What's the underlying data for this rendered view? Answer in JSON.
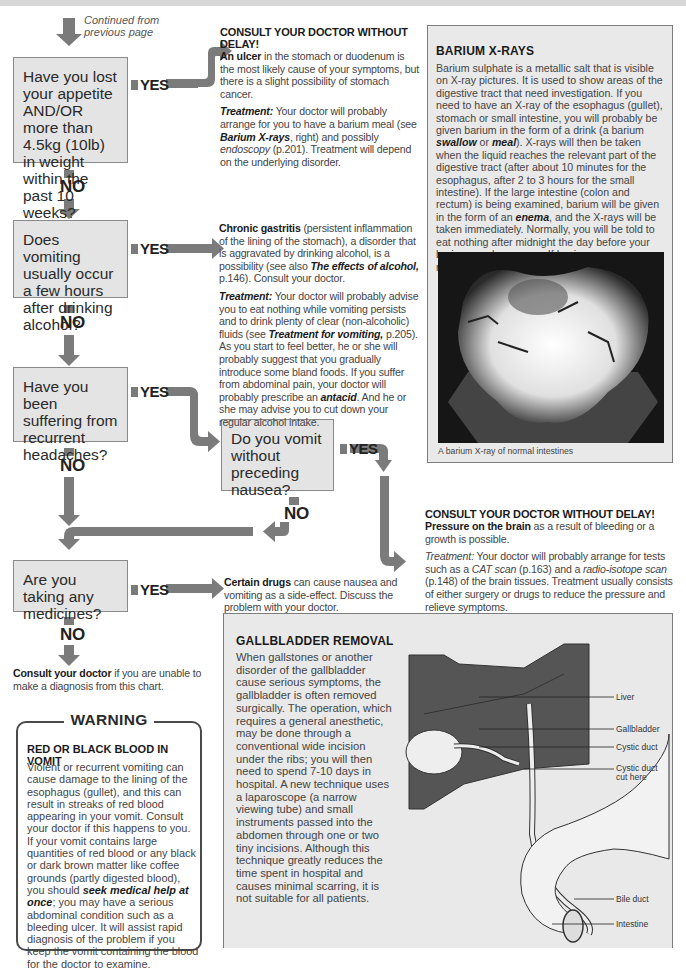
{
  "continued_note": "Continued from previous page",
  "flow_labels": {
    "yes": "YES",
    "no": "NO"
  },
  "questions": [
    {
      "id": "appetite",
      "text": "Have you lost your appetite AND/OR more than 4.5kg (10lb) in weight within the past 10 weeks?"
    },
    {
      "id": "alcohol",
      "text": "Does vomiting usually occur a few hours after drinking alcohol?"
    },
    {
      "id": "headaches",
      "text": "Have you been suffering from recurrent headaches?"
    },
    {
      "id": "nausea",
      "text": "Do you vomit without preceding nausea?"
    },
    {
      "id": "medicines",
      "text": "Are you taking any medicines?"
    }
  ],
  "answers": {
    "ulcer": {
      "heading": "CONSULT YOUR DOCTOR WITHOUT DELAY!",
      "lead_bold": "An ulcer",
      "lead_rest": " in the stomach or duodenum is the most likely cause of your symptoms, but there is a slight possibility of stomach cancer.",
      "treatment_label": "Treatment:",
      "treatment_a": " Your doctor will probably arrange for you to have a barium meal (see ",
      "treatment_ref1": "Barium X-rays",
      "treatment_b": ", right) and possibly ",
      "treatment_ref2": "endoscopy",
      "treatment_c": " (p.201). Treatment will depend on the underlying disorder."
    },
    "gastritis": {
      "lead_bold": "Chronic gastritis",
      "lead_a": " (persistent inflammation of the lining of the stomach), a disorder that is aggravated by drinking alcohol, is a possibility (see also ",
      "lead_ref": "The effects of alcohol,",
      "lead_b": " p.146). Consult your doctor.",
      "treatment_label": "Treatment:",
      "treatment_a": " Your doctor will probably advise you to eat nothing while vomiting persists and to drink plenty of clear (non-alcoholic) fluids (see ",
      "treatment_ref1": "Treatment for vomiting,",
      "treatment_b": " p.205). As you start to feel better, he or she will probably suggest that you gradually introduce some bland foods. If you suffer from abdominal pain, your doctor will probably prescribe an ",
      "treatment_ref2": "antacid",
      "treatment_c": ". And he or she may advise you to cut down your regular alcohol intake."
    },
    "brain": {
      "heading": "CONSULT YOUR DOCTOR WITHOUT DELAY!",
      "lead_bold": "Pressure on the brain",
      "lead_rest": " as a result of bleeding or a growth is possible.",
      "treatment_label": "Treatment:",
      "treatment_a": " Your doctor will probably arrange for tests such as a ",
      "treatment_ref1": "CAT scan",
      "treatment_b": " (p.163) and a ",
      "treatment_ref2": "radio-isotope scan",
      "treatment_c": " (p.148) of the brain tissues. Treatment usually consists of either surgery or drugs to reduce the pressure and relieve symptoms."
    },
    "drugs": {
      "lead_bold": "Certain drugs",
      "lead_rest": " can cause nausea and vomiting as a side-effect. Discuss the problem with your doctor."
    },
    "consult": {
      "lead_bold": "Consult your doctor",
      "lead_rest": " if you are unable to make a diagnosis from this chart."
    }
  },
  "barium_panel": {
    "title": "BARIUM X-RAYS",
    "body_a": "Barium sulphate is a metallic salt that is visible on X-ray pictures. It is used to show areas of the digestive tract that need investigation. If you need to have an X-ray of the esophagus (gullet), stomach or small intestine, you will probably be given barium in the form of a drink (a barium ",
    "body_em1": "swallow",
    "body_b": " or ",
    "body_em2": "meal",
    "body_c": "). X-rays will then be taken when the liquid reaches the relevant part of the digestive tract (after about 10 minutes for the esophagus, after 2 to 3 hours for the small intestine). If the large intestine (colon and rectum) is being examined, barium will be given in the form of an ",
    "body_em3": "enema",
    "body_d": ", and the X-rays will be taken immediately. Normally, you will be told to eat nothing after midnight the day before your barium meal or enema. If having an enema, you may also be given a laxative to clear the bowel.",
    "image_caption": "A barium X-ray of normal intestines"
  },
  "gallbladder_panel": {
    "title": "GALLBLADDER REMOVAL",
    "body": "When gallstones or another disorder of the gallbladder cause serious symptoms, the gallbladder is often removed surgically. The operation, which requires a general anesthetic, may be done through a conventional wide incision under the ribs; you will then need to spend 7-10 days in hospital. A new technique uses a laparoscope (a narrow viewing tube) and small instruments passed into the abdomen through one or two tiny incisions. Although this technique greatly reduces the time spent in hospital and causes minimal scarring, it is not suitable for all patients.",
    "diagram_labels": [
      "Liver",
      "Gallbladder",
      "Cystic duct",
      "Cystic duct cut here",
      "Bile duct",
      "Intestine"
    ]
  },
  "warning_box": {
    "title": "WARNING",
    "heading": "RED OR BLACK BLOOD IN VOMIT",
    "body_a": "Violent or recurrent vomiting can cause damage to the lining of the esophagus (gullet), and this can result in streaks of red blood appearing in your vomit. Consult your doctor if this happens to you. If your vomit contains large quantities of red blood or any black or dark brown matter like coffee grounds (partly digested blood), you should ",
    "body_em": "seek medical help at once",
    "body_b": "; you may have a serious abdominal condition such as a bleeding ulcer. It will assist rapid diagnosis of the problem if you keep the vomit containing the blood for the doctor to examine."
  },
  "colors": {
    "question_box": "#e4e4e4",
    "arrow": "#7b7b7b",
    "panel_bg": "#e9e9e9",
    "text": "#444444"
  }
}
